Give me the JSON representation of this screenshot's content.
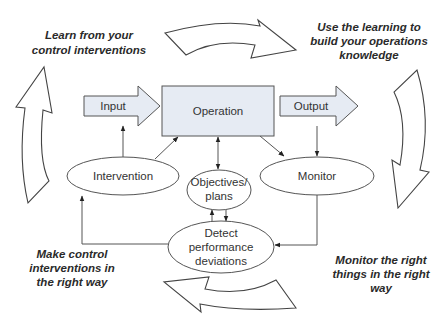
{
  "diagram": {
    "colors": {
      "box_fill": "#e6ebf3",
      "ellipse_fill": "#ffffff",
      "stroke": "#555555",
      "text": "#333333"
    },
    "nodes": {
      "input": "Input",
      "operation": "Operation",
      "output": "Output",
      "intervention": "Intervention",
      "monitor": "Monitor",
      "objectives": [
        "Objectives/",
        "plans"
      ],
      "detect": [
        "Detect",
        "performance",
        "deviations"
      ]
    },
    "captions": {
      "top_left": [
        "Learn from your",
        "control interventions"
      ],
      "top_right": [
        "Use the learning to",
        "build your operations",
        "knowledge"
      ],
      "bottom_left": [
        "Make control",
        "interventions in",
        "the right way"
      ],
      "bottom_right": [
        "Monitor the right",
        "things in the right",
        "way"
      ]
    },
    "edges": [
      {
        "from": "input",
        "to": "operation",
        "type": "block-arrow"
      },
      {
        "from": "operation",
        "to": "output",
        "type": "block-arrow"
      },
      {
        "from": "intervention",
        "to": "input"
      },
      {
        "from": "intervention",
        "to": "operation"
      },
      {
        "from": "operation",
        "to": "objectives",
        "bidirectional": true
      },
      {
        "from": "operation",
        "to": "monitor"
      },
      {
        "from": "output",
        "to": "monitor"
      },
      {
        "from": "monitor",
        "to": "detect"
      },
      {
        "from": "detect",
        "to": "intervention"
      },
      {
        "from": "detect",
        "to": "objectives"
      },
      {
        "from": "objectives",
        "to": "detect"
      }
    ],
    "cycle_arrows": [
      "top-clockwise",
      "right-downward",
      "bottom-leftward",
      "left-upward"
    ]
  }
}
